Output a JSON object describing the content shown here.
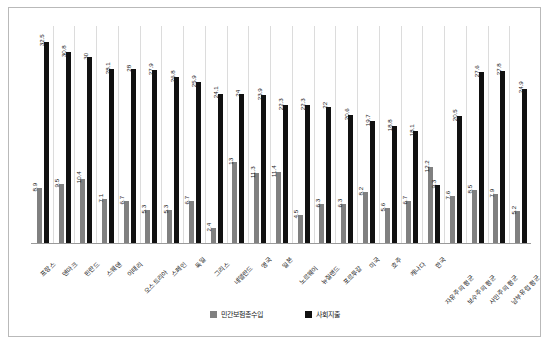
{
  "legend": {
    "items": [
      {
        "label": "민간보험총수입",
        "color": "#808080",
        "key": "private"
      },
      {
        "label": "사회지출",
        "color": "#111111",
        "key": "social"
      }
    ]
  },
  "chart_data": {
    "type": "bar",
    "title": "",
    "xlabel": "",
    "ylabel": "",
    "ylim": [
      0,
      35
    ],
    "grid": true,
    "legend_position": "bottom",
    "categories": [
      "프랑스",
      "덴마크",
      "핀란드",
      "스웨덴",
      "이태리",
      "오스트리아",
      "스페인",
      "독일",
      "그리스",
      "네델란드",
      "영국",
      "일본",
      "노르웨이",
      "뉴질랜드",
      "포르투갈",
      "미국",
      "호주",
      "캐나다",
      "한국",
      "자유주의 평균",
      "보수주의 평균",
      "사민주의 평균",
      "남부유럽 평균"
    ],
    "series": [
      {
        "name": "민간보험총수입",
        "color": "#808080",
        "values": [
          8.9,
          9.5,
          10.4,
          7.1,
          6.7,
          5.3,
          5.3,
          6.7,
          2.4,
          13,
          11.3,
          11.4,
          4.5,
          6.3,
          6.3,
          8.2,
          5.6,
          6.7,
          12.2,
          7.6,
          8.5,
          7.9,
          5.2
        ]
      },
      {
        "name": "사회지출",
        "color": "#111111",
        "values": [
          32.5,
          30.8,
          30,
          28.1,
          28,
          27.9,
          26.8,
          25.9,
          24.1,
          24,
          23.9,
          22.3,
          22.3,
          22,
          20.6,
          19.7,
          18.8,
          18.1,
          9.3,
          20.5,
          27.6,
          27.8,
          24.9
        ]
      }
    ]
  }
}
